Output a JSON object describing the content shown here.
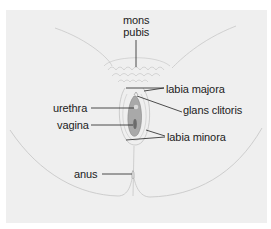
{
  "diagram": {
    "labels": [
      {
        "id": "mons_pubis",
        "line1": "mons",
        "line2": "pubis"
      },
      {
        "id": "labia_majora",
        "text": "labia majora"
      },
      {
        "id": "glans_clitoris",
        "text": "glans clitoris"
      },
      {
        "id": "urethra",
        "text": "urethra"
      },
      {
        "id": "vagina",
        "text": "vagina"
      },
      {
        "id": "labia_minora",
        "text": "labia minora"
      },
      {
        "id": "anus",
        "text": "anus"
      }
    ],
    "colors": {
      "background": "#efefef",
      "skin_line": "#b5b5b5",
      "leader_line": "#222222",
      "tissue": "#a8a8a8",
      "label_text": "#222222"
    }
  }
}
